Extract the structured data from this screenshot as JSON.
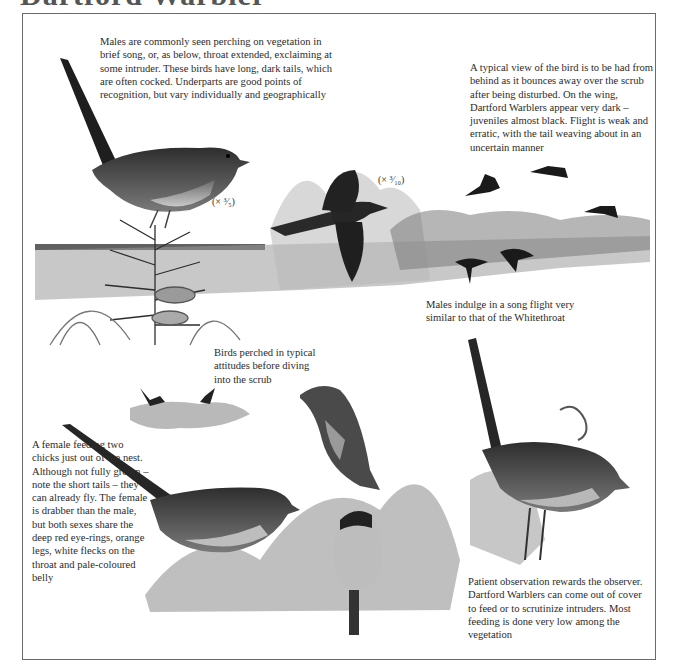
{
  "page": {
    "title": "Dartford Warbler"
  },
  "captions": {
    "males_perching": "Males are commonly seen perching on vegetation in brief song, or, as below, throat extended, exclaiming at some intruder. These birds have long, dark tails, which are often cocked. Underparts are good points of recognition, but vary individually and geographically",
    "typical_view": "A typical view of the bird is to be had from behind as it bounces away over the scrub after being disturbed. On the wing, Dartford Warblers appear very dark – juveniles almost black. Flight is weak and erratic, with the tail weaving about in an uncertain manner",
    "song_flight": "Males indulge in a song flight very similar to that of the Whitethroat",
    "perched_attitudes": "Birds perched in typical attitudes before diving into the scrub",
    "female_feeding": "A female feeding two chicks just out of the nest. Although not fully grown – note the short tails – they can already fly. The female is drabber than the male, but both sexes share the deep red eye-rings, orange legs, white flecks on the throat and pale-coloured belly",
    "patient_observation": "Patient observation rewards the observer. Dartford Warblers can come out of cover to feed or to scrutinize intruders. Most feeding is done very low among the vegetation"
  },
  "scales": {
    "perched_male": "(× 3/5)",
    "flying_male": "(× 3/10)"
  },
  "illustrations": [
    {
      "name": "perched-male-singing"
    },
    {
      "name": "flying-male"
    },
    {
      "name": "distant-flight-silhouettes"
    },
    {
      "name": "small-perched-pair"
    },
    {
      "name": "female-with-chicks"
    },
    {
      "name": "male-perched-bracken"
    }
  ]
}
